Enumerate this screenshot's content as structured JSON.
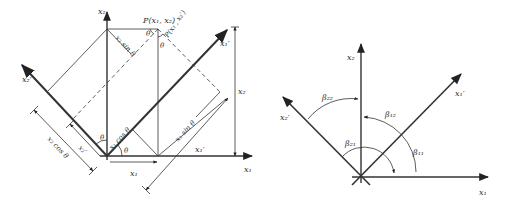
{
  "left_diagram": {
    "axes": {
      "x1": "x₁",
      "x2": "x₂",
      "x1_prime": "x₁′",
      "x2_prime": "x₂′"
    },
    "point_label": "P(x₁, x₂)",
    "point_label_prime": "P(x₁′, x₂′)",
    "angle": "θ",
    "dim_x1_cos": "x₁ cos θ",
    "dim_x2_sin": "x₂ sin θ",
    "dim_x2_cos": "x₂ cos θ",
    "dim_x1_sin": "x₁ sin θ",
    "dim_x1": "x₁",
    "dim_x2": "x₂",
    "dim_x1_prime": "x₁′",
    "dim_x2_prime": "x₂′"
  },
  "right_diagram": {
    "axes": {
      "x1": "x₁",
      "x2": "x₂",
      "x1_prime": "x₁′",
      "x2_prime": "x₂′"
    },
    "angles": {
      "beta11": "β₁₁",
      "beta12": "β₁₂",
      "beta21": "β₂₁",
      "beta22": "β₂₂"
    }
  },
  "colors": {
    "line": "#333333",
    "background": "#ffffff"
  }
}
